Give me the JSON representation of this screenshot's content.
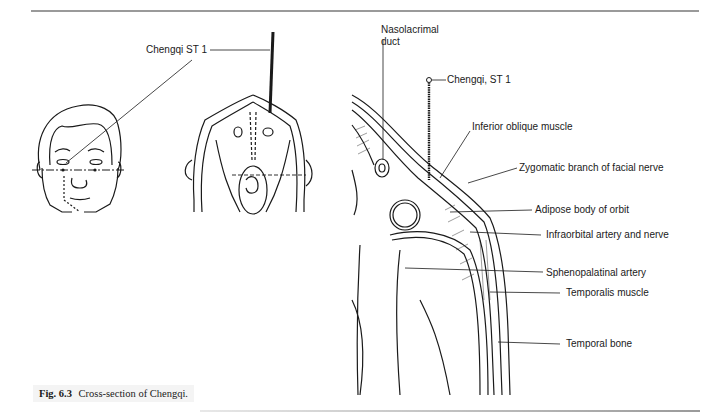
{
  "figure": {
    "caption_number": "Fig. 6.3",
    "caption_text": "Cross-section of Chengqi.",
    "left_panel": {
      "label_point": "Chengqi ST 1"
    },
    "right_panel": {
      "labels": [
        {
          "id": "nasolacrimal",
          "text": "Nasolacrimal\nduct",
          "line1": "Nasolacrimal",
          "line2": "duct"
        },
        {
          "id": "chengqi",
          "text": "Chengqi, ST 1"
        },
        {
          "id": "inferior_oblique",
          "text": "Inferior oblique muscle"
        },
        {
          "id": "zygomatic",
          "text": "Zygomatic branch of facial nerve"
        },
        {
          "id": "adipose",
          "text": "Adipose body of orbit"
        },
        {
          "id": "infraorbital",
          "text": "Infraorbital artery and nerve"
        },
        {
          "id": "sphenopalatinal",
          "text": "Sphenopalatinal artery"
        },
        {
          "id": "temporalis",
          "text": "Temporalis muscle"
        },
        {
          "id": "temporal_bone",
          "text": "Temporal bone"
        }
      ]
    }
  }
}
